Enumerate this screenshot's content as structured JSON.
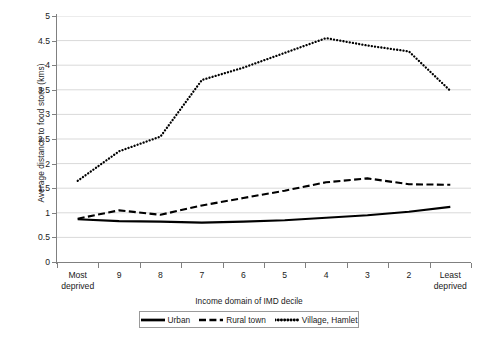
{
  "chart_data": {
    "type": "line",
    "title": "",
    "xlabel": "Income domain of IMD decile",
    "ylabel": "Average distance to food store (kms)",
    "categories": [
      "Most deprived",
      "9",
      "8",
      "7",
      "6",
      "5",
      "4",
      "3",
      "2",
      "Least deprived"
    ],
    "category_lines": [
      [
        "Most",
        "deprived"
      ],
      [
        "9",
        ""
      ],
      [
        "8",
        ""
      ],
      [
        "7",
        ""
      ],
      [
        "6",
        ""
      ],
      [
        "5",
        ""
      ],
      [
        "4",
        ""
      ],
      [
        "3",
        ""
      ],
      [
        "2",
        ""
      ],
      [
        "Least",
        "deprived"
      ]
    ],
    "ylim": [
      0,
      5
    ],
    "ytick_step": 0.5,
    "yticks": [
      "5",
      "4.5",
      "4",
      "3.5",
      "3",
      "2.5",
      "2",
      "1.5",
      "1",
      "0.5",
      "0"
    ],
    "ytick_values": [
      5,
      4.5,
      4,
      3.5,
      3,
      2.5,
      2,
      1.5,
      1,
      0.5,
      0
    ],
    "grid": true,
    "grid_axis": "y",
    "grid_color": "#d9d9d9",
    "legend_position": "bottom",
    "series": [
      {
        "name": "Urban",
        "style": "solid",
        "color": "#000000",
        "values": [
          0.87,
          0.83,
          0.82,
          0.8,
          0.82,
          0.85,
          0.9,
          0.95,
          1.02,
          1.12
        ]
      },
      {
        "name": "Rural town",
        "style": "dashed",
        "color": "#000000",
        "values": [
          0.88,
          1.05,
          0.96,
          1.15,
          1.3,
          1.45,
          1.62,
          1.7,
          1.58,
          1.57
        ]
      },
      {
        "name": "Village, Hamlet",
        "style": "dotted",
        "color": "#000000",
        "values": [
          1.65,
          2.25,
          2.55,
          3.7,
          3.95,
          4.25,
          4.55,
          4.4,
          4.28,
          3.48
        ]
      }
    ]
  },
  "legend": {
    "items": [
      {
        "label": "Urban"
      },
      {
        "label": "Rural town"
      },
      {
        "label": "Village, Hamlet"
      }
    ]
  }
}
